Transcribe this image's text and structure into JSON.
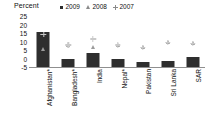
{
  "chart_data": {
    "type": "bar",
    "title": "",
    "ylabel": "Percent",
    "xlabel": "",
    "ylim": [
      -5,
      25
    ],
    "yticks": [
      25,
      20,
      15,
      10,
      5,
      0,
      -5
    ],
    "grid": false,
    "legend_position": "top",
    "categories": [
      "Afghanistan*",
      "Bangladesh*",
      "India",
      "Nepal*",
      "Pakistan",
      "Sri Lanka",
      "SAR"
    ],
    "series": [
      {
        "name": "2009",
        "marker": "square",
        "render": "bar",
        "color": "#2e2e2e",
        "values": [
          20.5,
          5.0,
          8.5,
          4.8,
          2.8,
          3.5,
          6.0
        ]
      },
      {
        "name": "2008",
        "marker": "triangle",
        "render": "marker",
        "color": "#9b9b9b",
        "values": [
          5.5,
          8.0,
          6.5,
          8.0,
          6.5,
          9.5,
          9.0
        ]
      },
      {
        "name": "2007",
        "marker": "plus",
        "render": "marker",
        "color": "#c9c9c9",
        "values": [
          14.0,
          8.0,
          11.5,
          8.0,
          6.5,
          9.5,
          9.0
        ]
      }
    ]
  },
  "legend": {
    "items": [
      {
        "label": "2009",
        "symbol": "square-marker"
      },
      {
        "label": "2008",
        "symbol": "triangle-marker"
      },
      {
        "label": "2007",
        "symbol": "plus-marker"
      }
    ]
  },
  "axis": {
    "y_title": "Percent",
    "y_tick_labels": [
      "25",
      "20",
      "15",
      "10",
      "5",
      "0",
      "-5"
    ],
    "x_tick_labels": [
      "Afghanistan*",
      "Bangladesh*",
      "India",
      "Nepal*",
      "Pakistan",
      "Sri Lanka",
      "SAR"
    ]
  },
  "colors": {
    "bar": "#2e2e2e",
    "series_2008": "#9b9b9b",
    "series_2007": "#c9c9c9",
    "axis": "#8f8f8f",
    "text": "#111111",
    "background": "#ffffff"
  }
}
